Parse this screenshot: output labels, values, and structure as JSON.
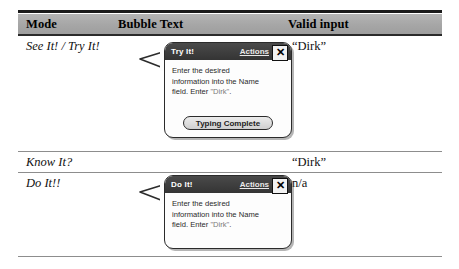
{
  "table": {
    "columns": [
      {
        "key": "mode",
        "label": "Mode"
      },
      {
        "key": "bubble",
        "label": "Bubble Text"
      },
      {
        "key": "valid",
        "label": "Valid input"
      }
    ],
    "rows": [
      {
        "mode": "See It! / Try It!",
        "valid": "“Dirk”",
        "has_bubble": true
      },
      {
        "mode": "Know It?",
        "valid": "“Dirk”",
        "has_bubble": false
      },
      {
        "mode": "Do It!!",
        "valid": "n/a",
        "has_bubble": true
      }
    ]
  },
  "bubbles": [
    {
      "title": "Try It!",
      "actions_label": "Actions",
      "close_label": "✕",
      "body_line_1": "Enter the desired",
      "body_line_2": "information into the Name",
      "body_line_3_pre": "field. Enter ",
      "body_line_3_quoted": "\"Dirk\"",
      "body_line_3_post": ".",
      "button_label": "Typing Complete",
      "has_button": true
    },
    {
      "title": "Do It!",
      "actions_label": "Actions",
      "close_label": "✕",
      "body_line_1": "Enter the desired",
      "body_line_2": "information into the Name",
      "body_line_3_pre": "field. Enter ",
      "body_line_3_quoted": "\"Dirk\"",
      "body_line_3_post": ".",
      "button_label": "",
      "has_button": false
    }
  ],
  "colors": {
    "header_band": "#a9a9a9",
    "rule_dark": "#1a1a1a",
    "rule_light": "#8d8d8d",
    "titlebar": "#3a3a3a",
    "button_face": "#d8d8d8"
  }
}
